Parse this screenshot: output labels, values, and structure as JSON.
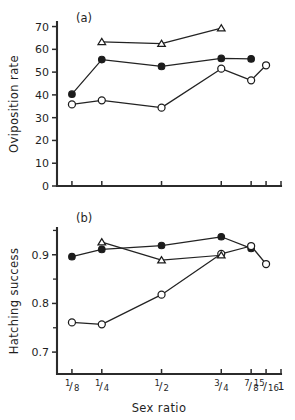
{
  "figure": {
    "width": 295,
    "height": 420,
    "background": "#ffffff",
    "ink_color": "#1f1f1f"
  },
  "chart_data": [
    {
      "type": "line",
      "panel_label": "(a)",
      "title": "",
      "xlabel": "",
      "ylabel": "Oviposition rate",
      "x_tick_labels": [
        "1/8",
        "1/4",
        "1/2",
        "3/4",
        "7/8",
        "15/16",
        "1"
      ],
      "x_tick_positions": [
        0.125,
        0.25,
        0.5,
        0.75,
        0.875,
        0.9375,
        1.0
      ],
      "x_tick_labels_visible": false,
      "xlim": [
        0.0625,
        1.0
      ],
      "ylim": [
        0,
        72
      ],
      "y_ticks": [
        0,
        10,
        20,
        30,
        40,
        50,
        60,
        70
      ],
      "y_tick_labels": [
        "0",
        "10",
        "20",
        "30",
        "40",
        "50",
        "60",
        "70"
      ],
      "grid": false,
      "legend": "none",
      "series": [
        {
          "name": "filled-circle",
          "marker": "filled-circle",
          "x": [
            0.125,
            0.25,
            0.5,
            0.75,
            0.875
          ],
          "values": [
            40.3,
            55.5,
            52.5,
            56.0,
            55.8
          ]
        },
        {
          "name": "open-circle",
          "marker": "open-circle",
          "x": [
            0.125,
            0.25,
            0.5,
            0.75,
            0.875,
            0.9375
          ],
          "values": [
            35.8,
            37.6,
            34.4,
            51.5,
            46.4,
            53.0
          ]
        },
        {
          "name": "open-triangle",
          "marker": "open-triangle",
          "x": [
            0.25,
            0.5,
            0.75
          ],
          "values": [
            63.3,
            62.5,
            69.3
          ]
        }
      ]
    },
    {
      "type": "line",
      "panel_label": "(b)",
      "title": "",
      "xlabel": "Sex ratio",
      "ylabel": "Hatching success",
      "x_tick_labels": [
        "1/8",
        "1/4",
        "1/2",
        "3/4",
        "7/8",
        "15/16",
        "1"
      ],
      "x_tick_positions": [
        0.125,
        0.25,
        0.5,
        0.75,
        0.875,
        0.9375,
        1.0
      ],
      "x_tick_labels_visible": true,
      "xlim": [
        0.0625,
        1.0
      ],
      "ylim": [
        0.655,
        0.955
      ],
      "y_ticks": [
        0.7,
        0.8,
        0.9
      ],
      "y_tick_labels": [
        "0.7",
        "0.8",
        "0.9"
      ],
      "y_minor_ticks": [
        0.75,
        0.85,
        0.95
      ],
      "grid": false,
      "legend": "none",
      "series": [
        {
          "name": "filled-circle",
          "marker": "filled-circle",
          "x": [
            0.125,
            0.25,
            0.5,
            0.75,
            0.875
          ],
          "values": [
            0.896,
            0.911,
            0.919,
            0.937,
            0.913
          ]
        },
        {
          "name": "open-circle",
          "marker": "open-circle",
          "x": [
            0.125,
            0.25,
            0.5,
            0.75,
            0.875,
            0.9375
          ],
          "values": [
            0.761,
            0.757,
            0.818,
            0.902,
            0.918,
            0.881
          ]
        },
        {
          "name": "open-triangle",
          "marker": "open-triangle",
          "x": [
            0.25,
            0.5,
            0.75
          ],
          "values": [
            0.926,
            0.889,
            0.899
          ]
        }
      ]
    }
  ]
}
